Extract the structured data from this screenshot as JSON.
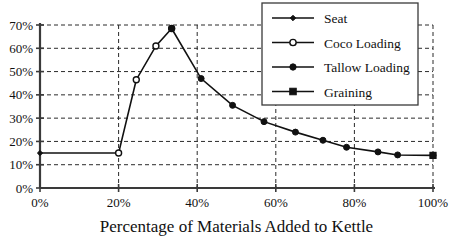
{
  "chart_data": {
    "type": "line",
    "title": "",
    "xlabel": "Percentage of Materials Added to Kettle",
    "ylabel": "",
    "xlim": [
      0,
      100
    ],
    "ylim": [
      0,
      70
    ],
    "grid": true,
    "legend_position": "top-right",
    "xticks": [
      "0%",
      "20%",
      "40%",
      "60%",
      "80%",
      "100%"
    ],
    "xtick_values": [
      0,
      20,
      40,
      60,
      80,
      100
    ],
    "yticks": [
      "0%",
      "10%",
      "20%",
      "30%",
      "40%",
      "50%",
      "60%",
      "70%"
    ],
    "ytick_values": [
      0,
      10,
      20,
      30,
      40,
      50,
      60,
      70
    ],
    "series": [
      {
        "name": "Seat",
        "marker": "small-diamond",
        "x": [
          0,
          20
        ],
        "y": [
          15,
          15
        ]
      },
      {
        "name": "Coco Loading",
        "marker": "open-circle",
        "x": [
          20,
          24.5,
          29.5,
          33.5
        ],
        "y": [
          15,
          46.5,
          61,
          68.5
        ]
      },
      {
        "name": "Tallow Loading",
        "marker": "filled-circle",
        "x": [
          33.5,
          41,
          49,
          57,
          65,
          72,
          78,
          86,
          91,
          100
        ],
        "y": [
          68.5,
          47,
          35.5,
          28.5,
          24,
          20.5,
          17.5,
          15.5,
          14.2,
          14
        ]
      },
      {
        "name": "Graining",
        "marker": "filled-square",
        "x": [
          100
        ],
        "y": [
          14
        ]
      }
    ]
  },
  "legend": {
    "items": [
      {
        "label": "Seat",
        "marker": "small-diamond"
      },
      {
        "label": "Coco Loading",
        "marker": "open-circle"
      },
      {
        "label": "Tallow Loading",
        "marker": "filled-circle"
      },
      {
        "label": "Graining",
        "marker": "filled-square"
      }
    ]
  },
  "colors": {
    "line": "#111111",
    "grid": "#2b2b2b",
    "axis": "#3a3a3a",
    "background": "#ffffff"
  }
}
